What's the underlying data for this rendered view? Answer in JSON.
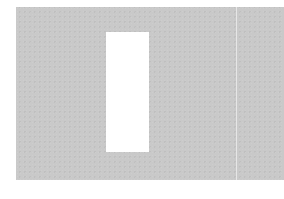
{
  "scene": {
    "description": "Gray textured card with a white rectangular cutout and a faint vertical fold line",
    "colors": {
      "background": "#ffffff",
      "panel": "#c9c9c9",
      "window": "#ffffff",
      "fold_line": "#e6e6e6"
    }
  }
}
